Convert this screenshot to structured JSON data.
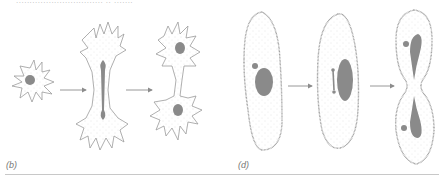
{
  "header": {
    "cropped_text": "................................ .. ......."
  },
  "panels": [
    {
      "label": "(b)",
      "description": "Amoeba undergoing binary fission: single cell, elongating cell with dividing nucleus, two daughter cells"
    },
    {
      "label": "(d)",
      "description": "Paramecium undergoing binary fission: single cell with macronucleus and micronucleus, dividing nuclei, constricting into two daughter cells"
    }
  ],
  "colors": {
    "outline": "#9a9a9a",
    "nucleus": "#8a8a8a",
    "arrow": "#8c8c8c",
    "stipple": "#c6c6c6",
    "rule": "#c8c8c8"
  }
}
